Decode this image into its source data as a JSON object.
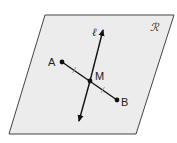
{
  "diagram": {
    "plane": {
      "label": "ℛ",
      "fill": "#ececec",
      "stroke": "#444444",
      "corners": [
        [
          45,
          15
        ],
        [
          174,
          15
        ],
        [
          136,
          134
        ],
        [
          9,
          134
        ]
      ]
    },
    "line": {
      "label": "ℓ",
      "start": [
        103,
        29
      ],
      "end": [
        79,
        122
      ],
      "arrows": "both"
    },
    "segment": {
      "from": "A",
      "to": "B",
      "tick_marks": 2
    },
    "points": [
      {
        "name": "A",
        "x": 62,
        "y": 62
      },
      {
        "name": "M",
        "x": 90,
        "y": 81
      },
      {
        "name": "B",
        "x": 117,
        "y": 100
      }
    ],
    "labels": {
      "A": "A",
      "M": "M",
      "B": "B",
      "ell": "ℓ",
      "R": "ℛ"
    }
  }
}
